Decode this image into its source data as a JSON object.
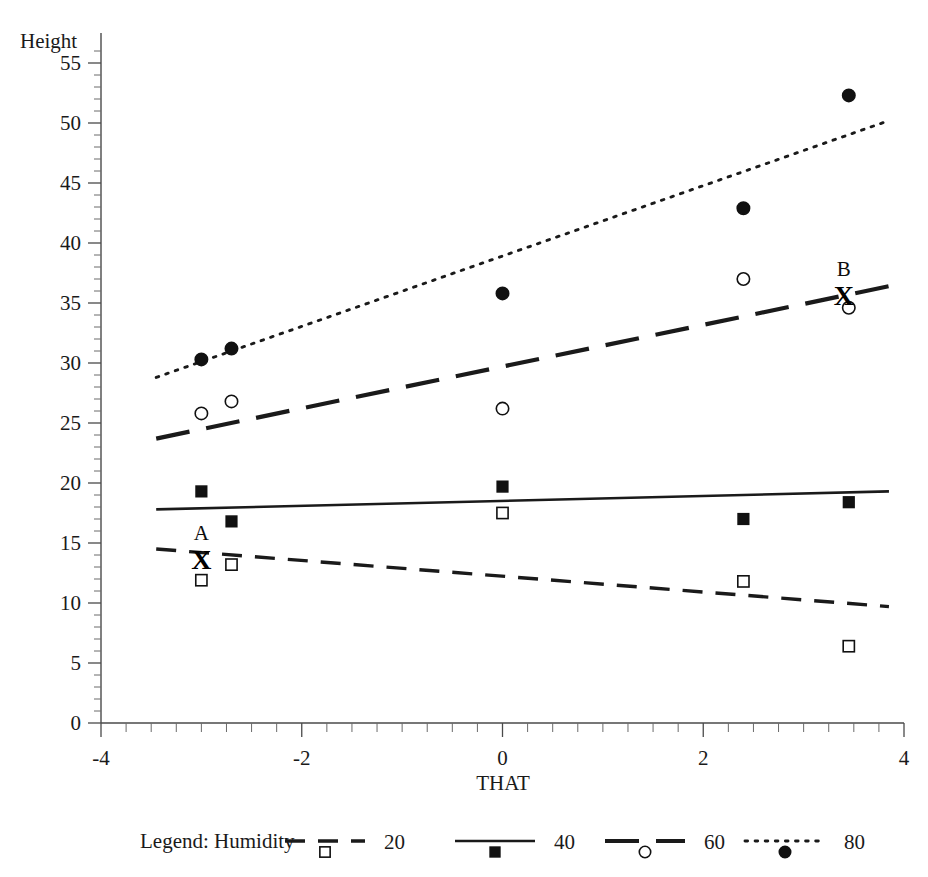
{
  "chart_data": {
    "type": "scatter",
    "title": "",
    "xlabel": "THAT",
    "ylabel": "Height",
    "xlim": [
      -4,
      4
    ],
    "ylim": [
      0,
      57.5
    ],
    "grid": false,
    "legend_position": "bottom",
    "legend_title": "Legend: Humidity",
    "x_ticks": [
      -4,
      -2,
      0,
      2,
      4
    ],
    "x_ticklabels": [
      "-4",
      "-2",
      "0",
      "2",
      "4"
    ],
    "x_minor_step": 0.25,
    "y_ticks": [
      0,
      5,
      10,
      15,
      20,
      25,
      30,
      35,
      40,
      45,
      50,
      55
    ],
    "y_ticklabels": [
      "0",
      "5",
      "10",
      "15",
      "20",
      "25",
      "30",
      "35",
      "40",
      "45",
      "50",
      "55"
    ],
    "y_minor_step": 1,
    "series": [
      {
        "name": "20",
        "label": "20",
        "marker": "open-square",
        "linestyle": "dashed",
        "points": [
          {
            "x": -3.0,
            "y": 11.9
          },
          {
            "x": -2.7,
            "y": 13.2
          },
          {
            "x": 0.0,
            "y": 17.5
          },
          {
            "x": 2.4,
            "y": 11.8
          },
          {
            "x": 3.45,
            "y": 6.4
          }
        ],
        "fit_line": {
          "x1": -3.45,
          "y1": 14.5,
          "x2": 3.85,
          "y2": 9.7
        }
      },
      {
        "name": "40",
        "label": "40",
        "marker": "filled-square",
        "linestyle": "solid",
        "points": [
          {
            "x": -3.0,
            "y": 19.3
          },
          {
            "x": -2.7,
            "y": 16.8
          },
          {
            "x": 0.0,
            "y": 19.7
          },
          {
            "x": 2.4,
            "y": 17.0
          },
          {
            "x": 3.45,
            "y": 18.4
          }
        ],
        "fit_line": {
          "x1": -3.45,
          "y1": 17.8,
          "x2": 3.85,
          "y2": 19.3
        }
      },
      {
        "name": "60",
        "label": "60",
        "marker": "open-circle",
        "linestyle": "long-dash",
        "points": [
          {
            "x": -3.0,
            "y": 25.8
          },
          {
            "x": -2.7,
            "y": 26.8
          },
          {
            "x": 0.0,
            "y": 26.2
          },
          {
            "x": 2.4,
            "y": 37.0
          },
          {
            "x": 3.45,
            "y": 34.6
          }
        ],
        "fit_line": {
          "x1": -3.45,
          "y1": 23.7,
          "x2": 3.85,
          "y2": 36.4
        }
      },
      {
        "name": "80",
        "label": "80",
        "marker": "filled-circle",
        "linestyle": "dotted",
        "points": [
          {
            "x": -3.0,
            "y": 30.3
          },
          {
            "x": -2.7,
            "y": 31.2
          },
          {
            "x": 0.0,
            "y": 35.8
          },
          {
            "x": 2.4,
            "y": 42.9
          },
          {
            "x": 3.45,
            "y": 52.3
          }
        ],
        "fit_line": {
          "x1": -3.45,
          "y1": 28.8,
          "x2": 3.85,
          "y2": 50.2
        }
      }
    ],
    "annotations": [
      {
        "label": "A",
        "x": -3.0,
        "y": 13.7,
        "marker": "X"
      },
      {
        "label": "B",
        "x": 3.4,
        "y": 35.7,
        "marker": "X"
      }
    ]
  }
}
